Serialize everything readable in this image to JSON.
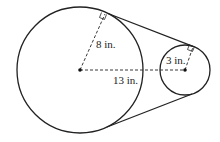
{
  "diagram": {
    "large_circle": {
      "cx": 80,
      "cy": 70,
      "r": 63,
      "radius_label": "8 in."
    },
    "small_circle": {
      "cx": 185,
      "cy": 70,
      "r": 25,
      "radius_label": "3 in."
    },
    "center_distance_label": "13 in.",
    "colors": {
      "stroke": "#222222",
      "background": "#ffffff"
    }
  }
}
